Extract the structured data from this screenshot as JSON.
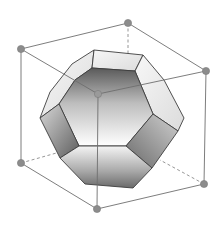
{
  "figure": {
    "cube_vertex_count": 7,
    "visible_text": [],
    "colors": {
      "background": "#ffffff",
      "edge": "#6e6e6e",
      "vertex": "#8c8c8c",
      "face_light": "#ececec",
      "face_mid": "#bdbdbd",
      "face_dark": "#6f6f6f",
      "face_outline": "#3d3d3d"
    }
  }
}
